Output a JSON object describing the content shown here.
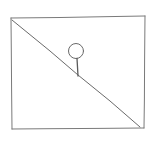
{
  "sketch": {
    "description": "Hand-drawn rectangle divided by a diagonal line with a lollipop shape resting on the diagonal",
    "colors": {
      "background": "#ffffff",
      "stroke": "#6a6a6a",
      "stroke_light": "#9a9a9a"
    },
    "frame": {
      "top_left": [
        11,
        18
      ],
      "top_right": [
        145,
        16
      ],
      "bottom_right": [
        144,
        128
      ],
      "bottom_left": [
        12,
        129
      ]
    },
    "diagonal": {
      "from": [
        12,
        20
      ],
      "to": [
        140,
        127
      ]
    },
    "lollipop": {
      "head_center": [
        76,
        51
      ],
      "head_radius": 8,
      "stem_from": [
        77,
        59
      ],
      "stem_to": [
        78,
        76
      ]
    }
  }
}
